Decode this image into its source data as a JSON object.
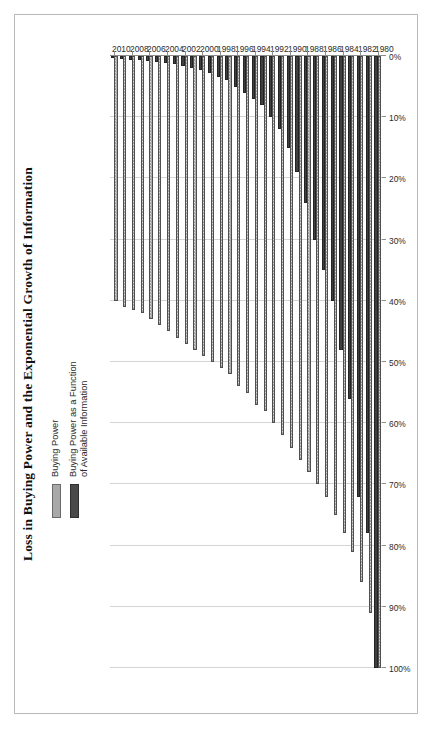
{
  "title": "Loss in Buying Power and the Exponential Growth of Information",
  "legend": [
    {
      "label": "Buying Power",
      "swatch": "#a8a8a8"
    },
    {
      "label": "Buying Power as a Function\nof Available Information",
      "swatch": "#4a4a4a"
    }
  ],
  "axis": {
    "value_ticks": [
      "100%",
      "90%",
      "80%",
      "70%",
      "60%",
      "50%",
      "40%",
      "30%",
      "20%",
      "10%",
      "0%"
    ],
    "category_ticks": [
      "1980",
      "1982",
      "1984",
      "1986",
      "1988",
      "1990",
      "1992",
      "1994",
      "1996",
      "1998",
      "2000",
      "2002",
      "2004",
      "2006",
      "2008",
      "2010"
    ]
  },
  "chart_data": {
    "type": "bar",
    "orientation": "horizontal",
    "title": "Loss in Buying Power and the Exponential Growth of Information",
    "xlabel": "",
    "ylabel": "",
    "xlim": [
      0,
      100
    ],
    "grid": true,
    "legend_position": "top-left",
    "value_unit": "%",
    "categories": [
      "1980",
      "1981",
      "1982",
      "1983",
      "1984",
      "1985",
      "1986",
      "1987",
      "1988",
      "1989",
      "1990",
      "1991",
      "1992",
      "1993",
      "1994",
      "1995",
      "1996",
      "1997",
      "1998",
      "1999",
      "2000",
      "2001",
      "2002",
      "2003",
      "2004",
      "2005",
      "2006",
      "2007",
      "2008",
      "2009",
      "2010"
    ],
    "series": [
      {
        "name": "Buying Power",
        "color": "#9d9d9d",
        "values": [
          100,
          91,
          86,
          81,
          78,
          75,
          72,
          70,
          68,
          66,
          64,
          62,
          60,
          58,
          57,
          55,
          54,
          52,
          51,
          50,
          49,
          48,
          47,
          46,
          45,
          44,
          43,
          42,
          41.5,
          41,
          40
        ]
      },
      {
        "name": "Buying Power as a Function of Available Information",
        "color": "#3f3f3f",
        "values": [
          100,
          78,
          72,
          56,
          48,
          40,
          35,
          30,
          24,
          19,
          15,
          12,
          10,
          8,
          7,
          6,
          5,
          4,
          3.4,
          2.8,
          2.3,
          1.9,
          1.6,
          1.3,
          1.1,
          0.9,
          0.8,
          0.7,
          0.6,
          0.5,
          0.4
        ]
      }
    ]
  }
}
